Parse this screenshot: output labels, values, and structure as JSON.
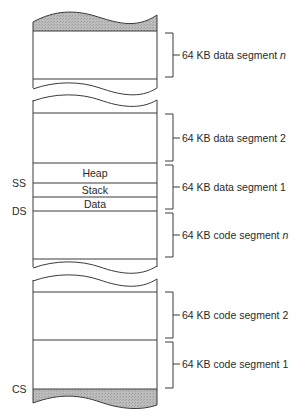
{
  "diagram": {
    "type": "memory-segmentation",
    "segments": [
      {
        "id": "data-n",
        "label_prefix": "64 KB data segment ",
        "label_suffix": "n"
      },
      {
        "id": "data-2",
        "label_prefix": "64 KB data segment 2",
        "label_suffix": ""
      },
      {
        "id": "data-1",
        "label_prefix": "64 KB data segment 1",
        "label_suffix": ""
      },
      {
        "id": "code-n",
        "label_prefix": "64 KB code segment ",
        "label_suffix": "n"
      },
      {
        "id": "code-2",
        "label_prefix": "64 KB code segment 2",
        "label_suffix": ""
      },
      {
        "id": "code-1",
        "label_prefix": "64 KB code segment 1",
        "label_suffix": ""
      }
    ],
    "inner_regions": {
      "heap": "Heap",
      "stack": "Stack",
      "data": "Data"
    },
    "registers": {
      "ss": "SS",
      "ds": "DS",
      "cs": "CS"
    },
    "colors": {
      "stroke": "#3a3a3a",
      "shade": "#b4b4b4",
      "background": "#ffffff"
    }
  }
}
